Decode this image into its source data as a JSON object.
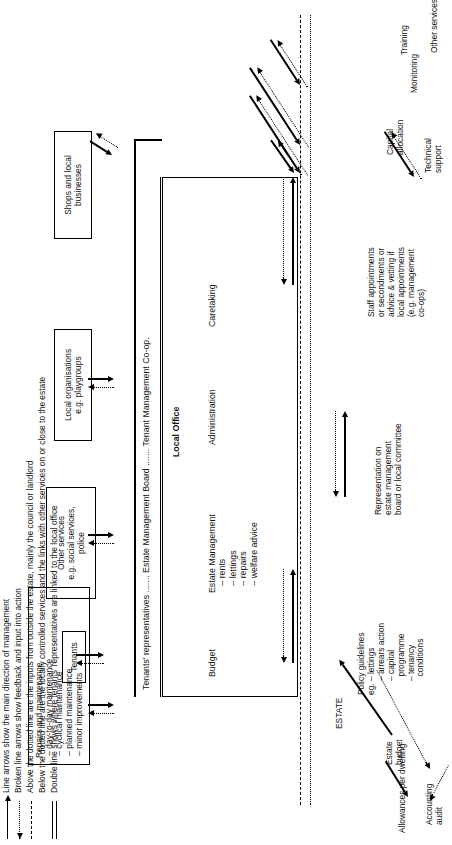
{
  "diagram": {
    "title_inside": "Local Office",
    "estate_label": "ESTATE",
    "office_columns": [
      "Budget",
      "Estate Management\n   – rents\n   – lettings\n   – repairs\n   – welfare advice",
      "Administration",
      "Caretaking"
    ],
    "board_strip": "Tenants' representatives ....... Estate Management Board ....... Tenant Management Co-op.",
    "left_inputs": [
      {
        "id": "capital-allocation",
        "text": "Capital\nallocation"
      },
      {
        "id": "monitoring",
        "text": "Monitoring"
      },
      {
        "id": "training",
        "text": "Training"
      },
      {
        "id": "other-services",
        "text": "Other services"
      },
      {
        "id": "technical-support",
        "text": "Technical\nsupport"
      },
      {
        "id": "staff-appointments",
        "text": "Staff appointments\nor secondments or\nadvice & vetting if\nlocal appointments\n(e.g. management\nco-ops)"
      },
      {
        "id": "representation",
        "text": "Representation on\nestate management\nboard or local committee"
      },
      {
        "id": "policy-guidelines",
        "text": "Policy guidelines\neg. – lettings\n      – arrears action\n      – capital\n        programme\n      – tenancy\n        conditions"
      },
      {
        "id": "allowances-per-dwelling",
        "text": "Allowances per dwelling"
      },
      {
        "id": "estate-budget",
        "text": "Estate\nbudget"
      },
      {
        "id": "accounting-audit",
        "text": "Accounting\naudit"
      }
    ],
    "right_boxes": [
      {
        "id": "shops-and-local-businesses",
        "text": "Shops and local\nbusinesses"
      },
      {
        "id": "local-organisations",
        "text": "Local organisations\ne.g. playgroups"
      },
      {
        "id": "other-services-social",
        "text": "Other services\ne.g. social services,\npolice"
      },
      {
        "id": "tenants",
        "text": "Tenants"
      },
      {
        "id": "repairs-and-maintenance",
        "text": "Repairs and maintenance\n – day-to-day maintenance\n – cyclical maintenance\n – planned maintenance\n – minor improvements"
      }
    ]
  },
  "legend": {
    "items": [
      {
        "symbol": "solid-arrow",
        "text": "Line arrows show the main direction of management"
      },
      {
        "symbol": "broken-arrow",
        "text": "Broken line arrows show feedback and input into action"
      },
      {
        "symbol": "dotted-line",
        "text": "Above the dotted line are the inputs from outside the estate, mainly the council or landlord"
      },
      {
        "symbol": "none",
        "text": "Below the dotted line are the locally controlled services and the links with other services on or close to the estate"
      },
      {
        "symbol": "double-line",
        "text": "Double line shows where tenants' representatives are linked to the local office"
      }
    ]
  },
  "colors": {
    "ink": "#000000",
    "paper": "#ffffff"
  }
}
